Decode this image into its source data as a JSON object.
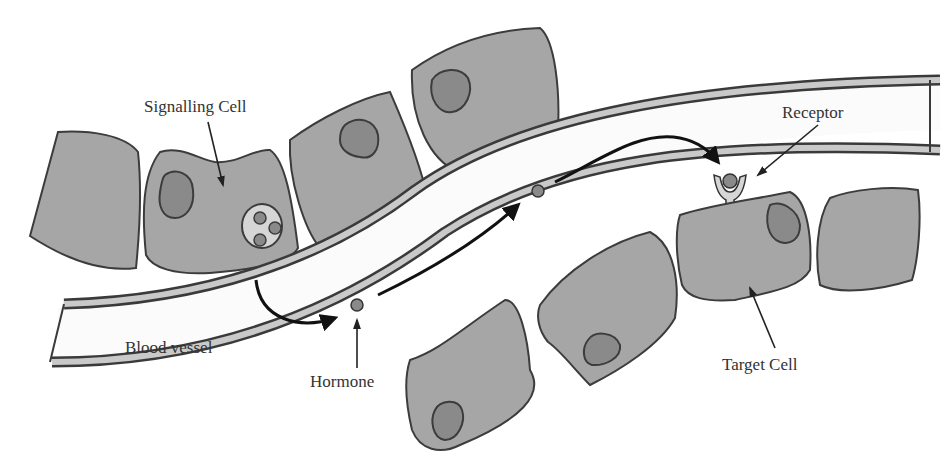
{
  "diagram": {
    "type": "endocrine-signaling",
    "labels": {
      "signalling_cell": "Signalling Cell",
      "receptor": "Receptor",
      "blood_vessel": "Blood vessel",
      "hormone": "Hormone",
      "target_cell": "Target Cell"
    },
    "colors": {
      "cell_fill": "#a6a6a6",
      "nucleus_fill": "#8a8a8a",
      "outline": "#3c3c3c",
      "vessel_lumen": "#fbfbfb",
      "arrow": "#111111",
      "text": "#333333"
    }
  }
}
